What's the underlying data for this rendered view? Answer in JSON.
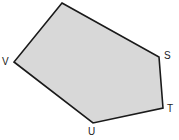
{
  "diagram": {
    "type": "pentagon",
    "fill_color": "#d8d8d8",
    "stroke_color": "#1a1a1a",
    "vertices": [
      {
        "name": "top",
        "label": "",
        "x": 62,
        "y": 3
      },
      {
        "name": "S",
        "label": "S",
        "x": 159,
        "y": 57
      },
      {
        "name": "T",
        "label": "T",
        "x": 163,
        "y": 108
      },
      {
        "name": "U",
        "label": "U",
        "x": 93,
        "y": 123
      },
      {
        "name": "V",
        "label": "V",
        "x": 14,
        "y": 62
      }
    ],
    "labels": {
      "s": "S",
      "t": "T",
      "u": "U",
      "v": "V"
    }
  }
}
